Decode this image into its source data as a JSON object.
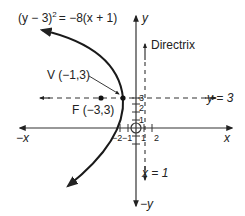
{
  "diagram": {
    "equation": "(y − 3)² = −8(x + 1)",
    "equation_parts": {
      "lhs_base": "(y − 3)",
      "exponent": "2",
      "rhs": "= −8(x + 1)"
    },
    "vertex_label": "V (−1,3)",
    "focus_label": "F (−3,3)",
    "directrix_label": "Directrix",
    "directrix_eq": "x = 1",
    "axis_of_symmetry_eq": "y = 3",
    "axes": {
      "x_pos": "x",
      "x_neg": "−x",
      "y_pos": "y",
      "y_neg": "−y"
    },
    "x_ticks": [
      "−2",
      "−1",
      "1",
      "2"
    ],
    "y_ticks": [
      "1",
      "2",
      "3"
    ],
    "colors": {
      "curve": "#1a1a1a",
      "axes": "#333333",
      "text": "#222222"
    }
  }
}
